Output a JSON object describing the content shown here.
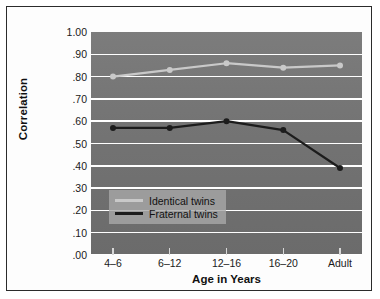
{
  "chart_data": {
    "type": "line",
    "title": "",
    "xlabel": "Age in Years",
    "ylabel": "Correlation",
    "categories": [
      "4–6",
      "6–12",
      "12–16",
      "16–20",
      "Adult"
    ],
    "ylim": [
      0.0,
      1.0
    ],
    "ytick_labels": [
      "1.00",
      ".90",
      ".80",
      ".70",
      ".60",
      ".50",
      ".40",
      ".30",
      ".20",
      ".10",
      ".00"
    ],
    "ytick_values": [
      1.0,
      0.9,
      0.8,
      0.7,
      0.6,
      0.5,
      0.4,
      0.3,
      0.2,
      0.1,
      0.0
    ],
    "grid": true,
    "legend_position": "lower-left-inside",
    "series": [
      {
        "name": "Identical twins",
        "color": "#c9c9c9",
        "values": [
          0.8,
          0.83,
          0.86,
          0.84,
          0.85
        ]
      },
      {
        "name": "Fraternal twins",
        "color": "#1c1c1c",
        "values": [
          0.57,
          0.57,
          0.6,
          0.56,
          0.39
        ]
      }
    ]
  },
  "legend": {
    "entries": [
      {
        "label": "Identical twins",
        "color": "#c9c9c9"
      },
      {
        "label": "Fraternal twins",
        "color": "#1c1c1c"
      }
    ]
  },
  "axes": {
    "y_title": "Correlation",
    "x_title": "Age in Years"
  },
  "colors": {
    "plot_background": "#757575",
    "gridline": "#ffffff",
    "card_background": "#fdfdfd",
    "border": "#2b2b2b",
    "identical_series": "#c9c9c9",
    "fraternal_series": "#1c1c1c"
  }
}
